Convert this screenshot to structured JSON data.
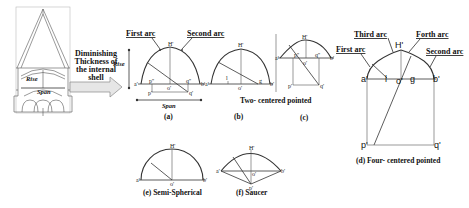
{
  "figure": {
    "building": {
      "rise_label": "Rise",
      "span_label": "Span"
    },
    "arrow_callout": {
      "lines": [
        "Diminishing",
        "Thickness of",
        "the internal",
        "shell"
      ]
    },
    "panel_a": {
      "caption": "(a)",
      "first_arc": "First arc",
      "second_arc": "Second arc",
      "rise_label": "Rise",
      "span_label": "Span",
      "points": {
        "H": "H'",
        "a": "a'",
        "b": "b'",
        "o": "o'",
        "p": "p''",
        "q": "q''",
        "p2": "p'",
        "q2": "q'"
      }
    },
    "panel_b": {
      "caption": "(b)",
      "points": {
        "H": "H'",
        "a": "a'",
        "b": "b'",
        "o": "o'",
        "l": "l",
        "g": "g"
      }
    },
    "panel_c": {
      "caption": "(c)",
      "points": {
        "H": "H'",
        "a": "a'",
        "b": "b'",
        "o": "o'",
        "p": "p''",
        "q": "q''",
        "p2": "p'",
        "q2": "q'"
      }
    },
    "two_centered_caption": "Two- centered pointed",
    "panel_d": {
      "caption": "(d) Four- centered pointed",
      "first_arc": "First arc",
      "second_arc": "Second arc",
      "third_arc": "Third arc",
      "forth_arc": "Forth arc",
      "points": {
        "H": "H'",
        "a": "a'",
        "b": "b'",
        "o": "o'",
        "l": "l",
        "g": "g",
        "p": "p'",
        "q": "q'"
      }
    },
    "panel_e": {
      "caption": "(e) Semi-Spherical",
      "points": {
        "H": "H'",
        "a": "a'",
        "b": "b'",
        "o": "o'"
      }
    },
    "panel_f": {
      "caption": "(f) Saucer",
      "points": {
        "H": "H'",
        "a": "a'",
        "b": "b'",
        "o": "o'",
        "p": "p'"
      }
    }
  }
}
